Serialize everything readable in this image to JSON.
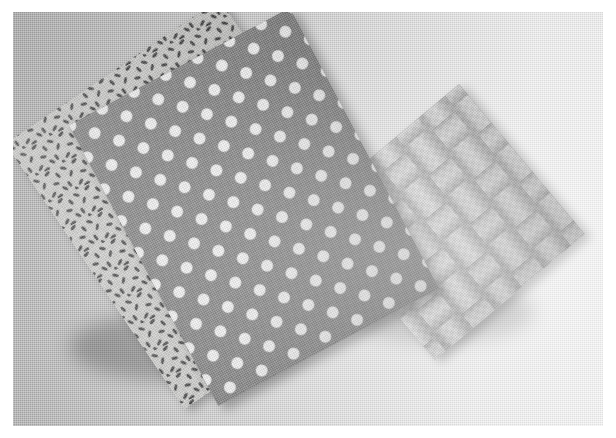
{
  "image": {
    "kind": "photograph",
    "subject": "three folded fabric swatches arranged overlapping on a linen surface",
    "orientation": "landscape",
    "border": {
      "style": "white photo border",
      "width_px": 13,
      "color": "#ffffff"
    },
    "backdrop": {
      "name": "linen tablecloth",
      "texture": "fine woven grid",
      "color_left": "#b2b2b2",
      "color_right": "#f4f4f4",
      "lighting": "light falls from upper right, shadows toward lower left"
    },
    "palette": {
      "fabric_dash_ground": "#cdcdcb",
      "fabric_dash_marks": "#3c3c3c",
      "fabric_dot_ground": "#828282",
      "fabric_dot_spots": "#f3f3f3",
      "fabric_woven": "#bdbdbd",
      "shadow": "rgba(0,0,0,0.25)"
    },
    "swatches": [
      {
        "id": "dashes",
        "label": "seed / dash print fabric",
        "position": "back left",
        "ground_color": "#cdcdcb",
        "motif_color": "#3c3c3c",
        "pattern": "scattered short dark dashes on pale ground",
        "rotation_deg": -34
      },
      {
        "id": "dots",
        "label": "polka dot fabric",
        "position": "center front",
        "ground_color": "#828282",
        "motif_color": "#f3f3f3",
        "pattern": "regular white polka dots on medium grey",
        "rotation_deg": -28
      },
      {
        "id": "woven",
        "label": "basket-weave ribbon fabric",
        "position": "right",
        "ground_color": "#bdbdbd",
        "motif_color": "#a6a6a6",
        "pattern": "interlaced woven ribbon squares, basket weave",
        "rotation_deg": -40
      }
    ]
  }
}
